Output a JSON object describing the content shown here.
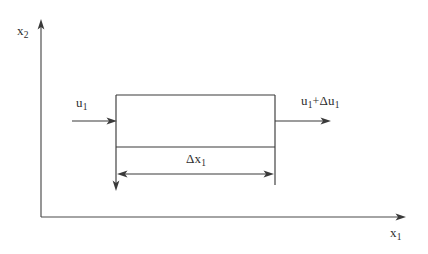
{
  "figure": {
    "kind": "control-volume-diagram",
    "background_color": "#ffffff",
    "line_color": "#3a3a3a",
    "text_color": "#2e2e2e"
  },
  "axes": {
    "vertical": {
      "label_main": "x",
      "label_sub": "2",
      "label_full": "x2",
      "origin": {
        "x": 41,
        "y": 217
      },
      "tip": {
        "x": 41,
        "y": 20
      }
    },
    "horizontal": {
      "label_main": "x",
      "label_sub": "1",
      "label_full": "x1",
      "origin": {
        "x": 41,
        "y": 217
      },
      "tip": {
        "x": 405,
        "y": 217
      }
    }
  },
  "control_volume": {
    "left_x": 116,
    "right_x": 275,
    "top_y": 95,
    "bottom_y": 147,
    "left_extension_y": 190,
    "right_extension_y": 185
  },
  "flow_in": {
    "label_main": "u",
    "label_sub": "1",
    "label_full": "u1",
    "arrow_y": 121,
    "arrow_start_x": 72,
    "arrow_end_x": 116
  },
  "flow_out": {
    "label_prefix": "u",
    "label_prefix_sub": "1",
    "label_operator": "+",
    "label_delta": "Δu",
    "label_delta_sub": "1",
    "label_full": "u1+Δu1",
    "arrow_y": 121,
    "arrow_start_x": 275,
    "arrow_end_x": 331
  },
  "dimension": {
    "label_main": "Δx",
    "label_sub": "1",
    "label_full": "Δx1",
    "arrow_y": 174,
    "arrow_left_x": 118,
    "arrow_right_x": 273,
    "double_headed": true
  }
}
